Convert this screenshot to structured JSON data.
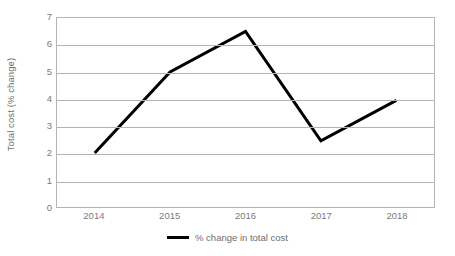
{
  "chart_data": {
    "type": "line",
    "title": "",
    "xlabel": "",
    "ylabel": "Total cost (% change)",
    "categories": [
      "2014",
      "2015",
      "2016",
      "2017",
      "2018"
    ],
    "series": [
      {
        "name": "% change in total cost",
        "values": [
          2.0,
          5.0,
          6.5,
          2.45,
          3.95
        ],
        "color": "#000000"
      }
    ],
    "ylim": [
      0,
      7
    ],
    "yticks": [
      0,
      1,
      2,
      3,
      4,
      5,
      6,
      7
    ],
    "ytick_labels": [
      "0",
      "1",
      "2",
      "3",
      "4",
      "5",
      "6",
      "7"
    ],
    "grid": true,
    "grid_axis": "y",
    "grid_color": "#b4b4b4",
    "legend": true,
    "legend_position": "bottom-center",
    "legend_entries": [
      "% change in total cost"
    ],
    "plot_background": "#ffffff",
    "tick_label_color": "#7a7a7a",
    "axis_title_color": "#6e6e6e",
    "line_width": 3,
    "markers": false
  }
}
